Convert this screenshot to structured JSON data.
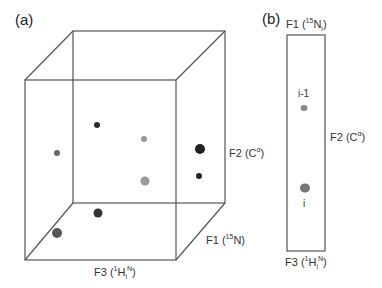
{
  "panel_a": {
    "label": "(a)",
    "axes": {
      "f1": {
        "name": "F1",
        "nucleus_sup": "15",
        "nucleus": "N"
      },
      "f2": {
        "name": "F2",
        "nucleus": "C",
        "nucleus_sup": "α"
      },
      "f3": {
        "name": "F3",
        "nucleus_sup": "1",
        "nucleus": "H",
        "sub": "i",
        "sup2": "N"
      }
    }
  },
  "panel_b": {
    "label": "(b)",
    "axes": {
      "f1": {
        "name": "F1",
        "nucleus_sup": "15",
        "nucleus": "N",
        "sub": "i"
      },
      "f2": {
        "name": "F2",
        "nucleus": "C",
        "nucleus_sup": "α"
      },
      "f3": {
        "name": "F3",
        "nucleus_sup": "1",
        "nucleus": "H",
        "sub": "i",
        "sup2": "N"
      }
    },
    "peaks": [
      {
        "label": "i-1"
      },
      {
        "label": "i"
      }
    ]
  },
  "colors": {
    "line": "#555555",
    "dark_peak": "#2a2a2a",
    "gray_peak": "#8a8a8a",
    "mid_peak": "#5a5a5a"
  }
}
